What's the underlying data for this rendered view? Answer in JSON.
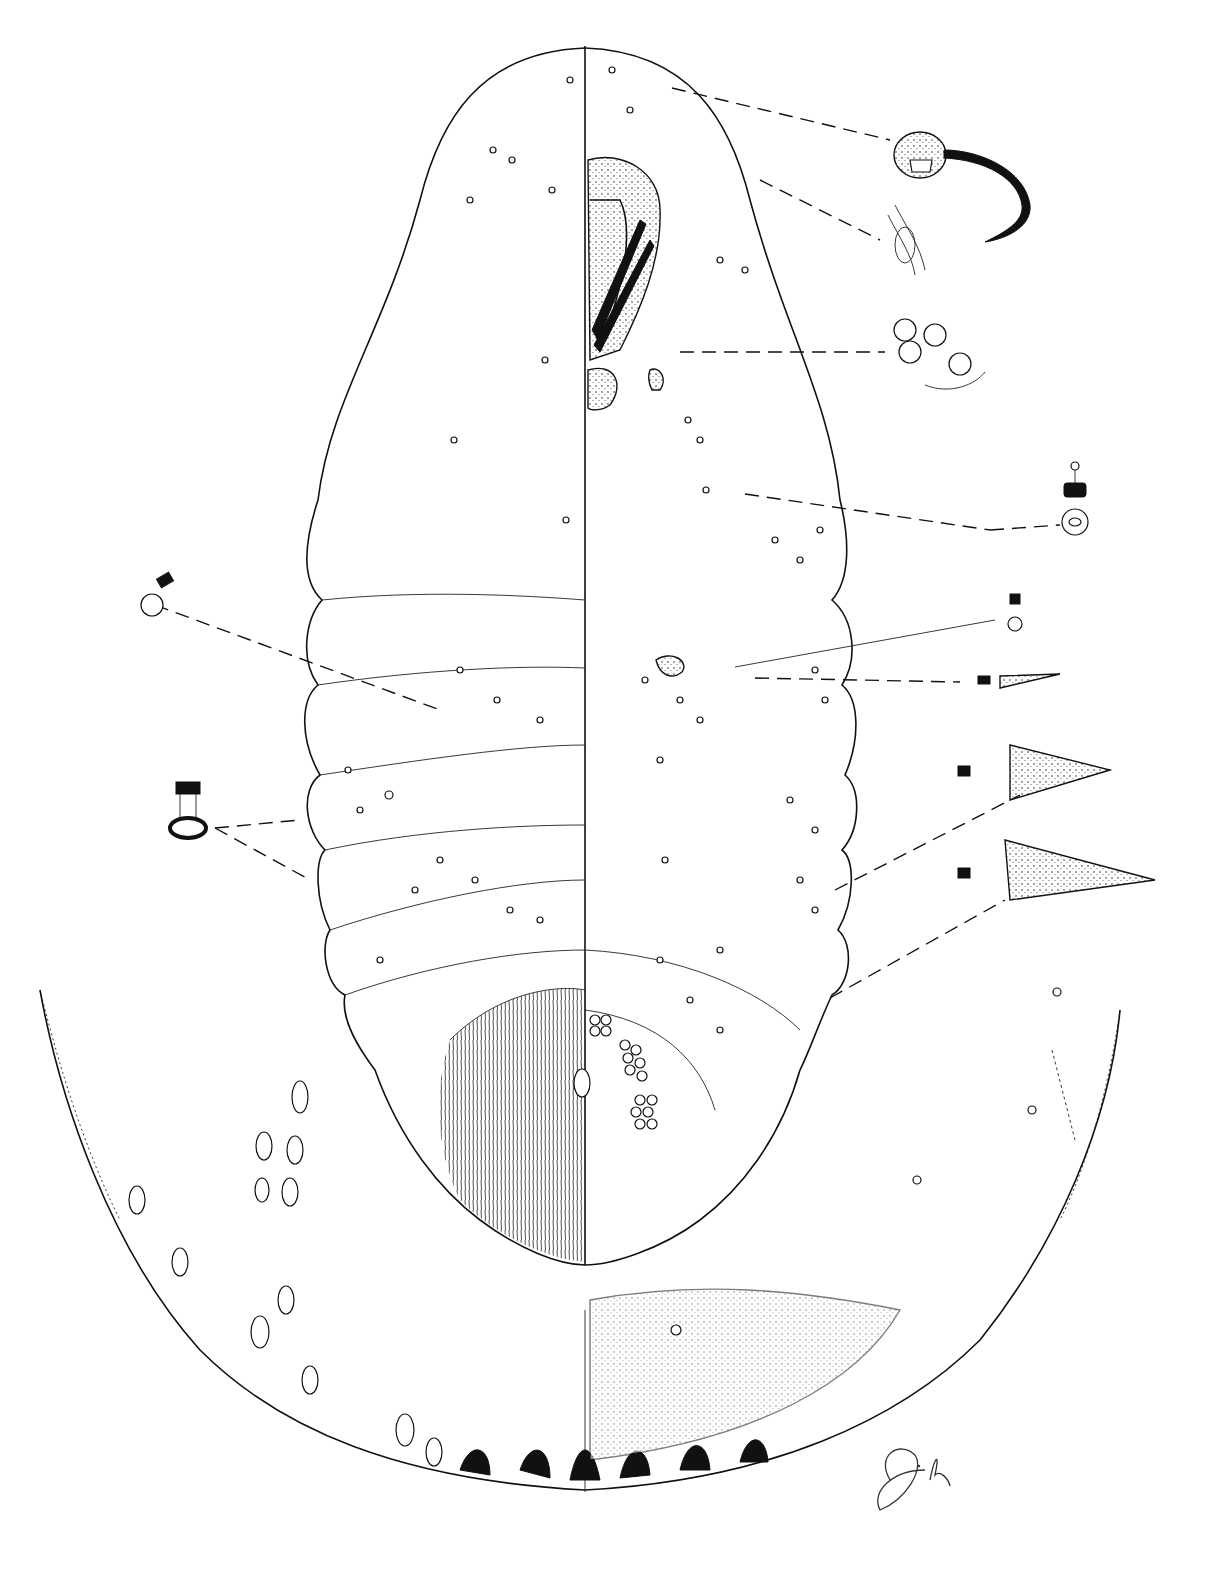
{
  "figure": {
    "type": "scientific-illustration",
    "layout": "left half dorsum, right half venter, with enlarged detail insets",
    "signature": "Dh"
  },
  "insets": [
    {
      "name": "spiracle-detail",
      "position": "top-right"
    },
    {
      "name": "eye-detail",
      "position": "upper-right"
    },
    {
      "name": "quinquelocular-pores-detail",
      "position": "right"
    },
    {
      "name": "tubular-duct-detail-1",
      "position": "right-middle"
    },
    {
      "name": "tubular-duct-detail-2",
      "position": "right-middle"
    },
    {
      "name": "setae-detail-1",
      "position": "right"
    },
    {
      "name": "setae-detail-2",
      "position": "right"
    },
    {
      "name": "setae-detail-3",
      "position": "right-lower"
    },
    {
      "name": "dorsal-duct-detail",
      "position": "left-middle"
    },
    {
      "name": "oral-collar-duct-detail",
      "position": "left-lower"
    },
    {
      "name": "anal-lobe-margin-enlargement",
      "position": "bottom"
    }
  ],
  "colors": {
    "ink": "#111111",
    "paper": "#ffffff"
  }
}
